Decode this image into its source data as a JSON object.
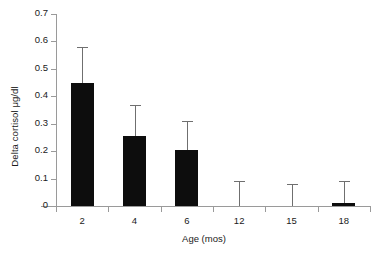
{
  "chart_data": {
    "type": "bar",
    "title": "",
    "xlabel": "Age (mos)",
    "ylabel": "Delta cortisol μg/dl",
    "categories": [
      "2",
      "4",
      "6",
      "12",
      "15",
      "18"
    ],
    "values": [
      0.45,
      0.255,
      0.205,
      0.0,
      0.0,
      0.012
    ],
    "error_upper": [
      0.58,
      0.37,
      0.31,
      0.09,
      0.08,
      0.09
    ],
    "error_style": "upper-only-whisker",
    "ylim": [
      0,
      0.7
    ],
    "yticks": [
      "0",
      "0.1",
      "0.2",
      "0.3",
      "0.4",
      "0.5",
      "0.6",
      "0.7"
    ],
    "ytick_values": [
      0,
      0.1,
      0.2,
      0.3,
      0.4,
      0.5,
      0.6,
      0.7
    ],
    "grid": false,
    "legend": "none",
    "bar_color": "#0d0d0d",
    "error_color": "#6f6f6f",
    "axis_color": "#9a9a9a",
    "background": "#ffffff"
  }
}
